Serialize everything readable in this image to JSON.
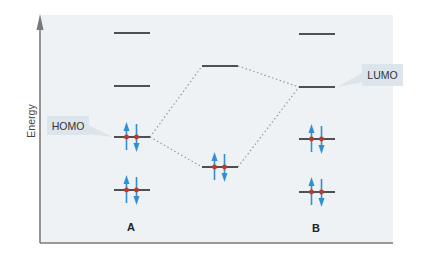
{
  "axis": {
    "ylabel": "Energy"
  },
  "callouts": {
    "homo": "HOMO",
    "lumo": "LUMO"
  },
  "molecules": {
    "a_label": "A",
    "b_label": "B"
  },
  "levels": {
    "A": [
      {
        "name": "level-a-4",
        "electrons": 0
      },
      {
        "name": "level-a-3",
        "electrons": 0
      },
      {
        "name": "level-a-homo",
        "electrons": 2
      },
      {
        "name": "level-a-1",
        "electrons": 2
      }
    ],
    "middle": [
      {
        "name": "level-mid-antibonding",
        "electrons": 0
      },
      {
        "name": "level-mid-bonding",
        "electrons": 2
      }
    ],
    "B": [
      {
        "name": "level-b-4",
        "electrons": 0
      },
      {
        "name": "level-b-lumo",
        "electrons": 0
      },
      {
        "name": "level-b-2",
        "electrons": 2
      },
      {
        "name": "level-b-1",
        "electrons": 2
      }
    ]
  },
  "colors": {
    "panel": "#eef2f5",
    "axis": "#7a7a7a",
    "level": "#1a1a1a",
    "arrow": "#2f8fd0",
    "dot": "#c0392b",
    "dotted": "#9a9a9a",
    "callout_bg": "#dde5ec"
  }
}
